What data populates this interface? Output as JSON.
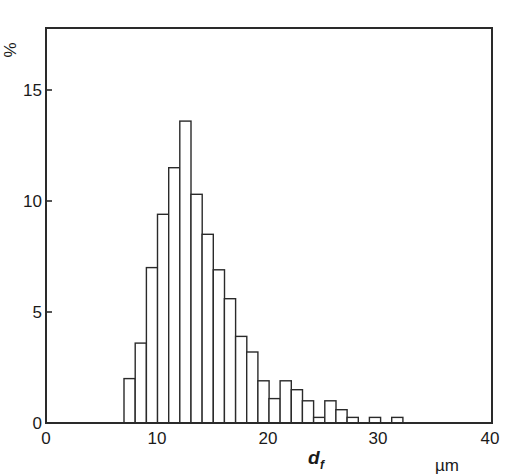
{
  "chart_data": {
    "type": "bar",
    "subtype": "histogram",
    "title": "",
    "xlabel": "d",
    "xlabel_subscript": "f",
    "xunit": "µm",
    "ylabel": "%",
    "xlim": [
      0,
      40
    ],
    "ylim": [
      0,
      17.8
    ],
    "xticks": [
      0,
      10,
      20,
      30,
      40
    ],
    "yticks": [
      0,
      5,
      10,
      15
    ],
    "grid": false,
    "legend": null,
    "bin_width": 1,
    "bins": [
      {
        "x0": 7,
        "x1": 8,
        "value": 2.0
      },
      {
        "x0": 8,
        "x1": 9,
        "value": 3.6
      },
      {
        "x0": 9,
        "x1": 10,
        "value": 7.0
      },
      {
        "x0": 10,
        "x1": 11,
        "value": 9.4
      },
      {
        "x0": 11,
        "x1": 12,
        "value": 11.5
      },
      {
        "x0": 12,
        "x1": 13,
        "value": 13.6
      },
      {
        "x0": 13,
        "x1": 14,
        "value": 10.3
      },
      {
        "x0": 14,
        "x1": 15,
        "value": 8.5
      },
      {
        "x0": 15,
        "x1": 16,
        "value": 6.9
      },
      {
        "x0": 16,
        "x1": 17,
        "value": 5.6
      },
      {
        "x0": 17,
        "x1": 18,
        "value": 3.9
      },
      {
        "x0": 18,
        "x1": 19,
        "value": 3.2
      },
      {
        "x0": 19,
        "x1": 20,
        "value": 1.9
      },
      {
        "x0": 20,
        "x1": 21,
        "value": 1.1
      },
      {
        "x0": 21,
        "x1": 22,
        "value": 1.9
      },
      {
        "x0": 22,
        "x1": 23,
        "value": 1.5
      },
      {
        "x0": 23,
        "x1": 24,
        "value": 1.0
      },
      {
        "x0": 24,
        "x1": 25,
        "value": 0.25
      },
      {
        "x0": 25,
        "x1": 26,
        "value": 1.0
      },
      {
        "x0": 26,
        "x1": 27,
        "value": 0.6
      },
      {
        "x0": 27,
        "x1": 28,
        "value": 0.25
      },
      {
        "x0": 28,
        "x1": 29,
        "value": 0
      },
      {
        "x0": 29,
        "x1": 30,
        "value": 0.25
      },
      {
        "x0": 30,
        "x1": 31,
        "value": 0
      },
      {
        "x0": 31,
        "x1": 32,
        "value": 0.25
      }
    ],
    "categories": [
      "7-8",
      "8-9",
      "9-10",
      "10-11",
      "11-12",
      "12-13",
      "13-14",
      "14-15",
      "15-16",
      "16-17",
      "17-18",
      "18-19",
      "19-20",
      "20-21",
      "21-22",
      "22-23",
      "23-24",
      "24-25",
      "25-26",
      "26-27",
      "27-28",
      "28-29",
      "29-30",
      "30-31",
      "31-32"
    ],
    "values": [
      2.0,
      3.6,
      7.0,
      9.4,
      11.5,
      13.6,
      10.3,
      8.5,
      6.9,
      5.6,
      3.9,
      3.2,
      1.9,
      1.1,
      1.9,
      1.5,
      1.0,
      0.25,
      1.0,
      0.6,
      0.25,
      0,
      0.25,
      0,
      0.25
    ]
  },
  "labels": {
    "y_unit": "%",
    "x_symbol": "d",
    "x_subscript": "f",
    "x_unit": "µm",
    "x_ticks": [
      "0",
      "10",
      "20",
      "30",
      "40"
    ],
    "y_ticks": [
      "0",
      "5",
      "10",
      "15"
    ]
  }
}
